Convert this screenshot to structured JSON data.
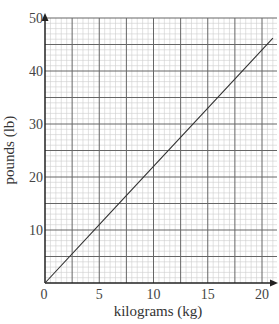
{
  "chart_data": {
    "type": "line",
    "title": "",
    "xlabel": "kilograms (kg)",
    "ylabel": "pounds (lb)",
    "xlim": [
      0,
      21.3
    ],
    "ylim": [
      0,
      50
    ],
    "x_ticks": [
      0,
      5,
      10,
      15,
      20
    ],
    "y_ticks": [
      10,
      20,
      30,
      40,
      50
    ],
    "grid": {
      "on": true,
      "x_major_step": 2.5,
      "x_minor_step": 0.5,
      "y_major_step": 5,
      "y_minor_step": 1
    },
    "legend": null,
    "series": [
      {
        "name": "kg to lb conversion",
        "x": [
          0,
          5,
          10,
          15,
          20,
          21
        ],
        "y": [
          0,
          11,
          22,
          33,
          44,
          46.2
        ]
      }
    ],
    "colors": {
      "line": "#333333",
      "major_grid": "#666666",
      "minor_grid": "#cccccc",
      "axis": "#222222"
    }
  }
}
